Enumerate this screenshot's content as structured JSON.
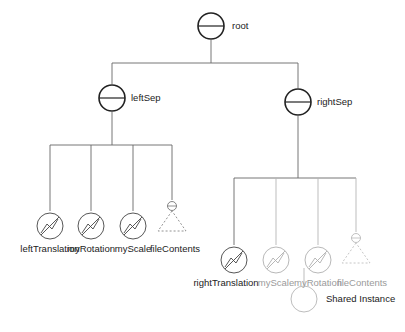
{
  "diagram": {
    "type": "scene-graph",
    "nodes": [
      {
        "id": "root",
        "label": "root",
        "kind": "separator",
        "shared": false
      },
      {
        "id": "leftSep",
        "label": "leftSep",
        "kind": "separator",
        "shared": false
      },
      {
        "id": "rightSep",
        "label": "rightSep",
        "kind": "separator",
        "shared": false
      },
      {
        "id": "leftTranslation",
        "label": "leftTranslation",
        "kind": "transform",
        "shared": false
      },
      {
        "id": "myRotation_l",
        "label": "myRotation",
        "kind": "transform",
        "shared": true
      },
      {
        "id": "myScale_l",
        "label": "myScale",
        "kind": "transform",
        "shared": true
      },
      {
        "id": "fileContents_l",
        "label": "fileContents",
        "kind": "subgraph",
        "shared": true
      },
      {
        "id": "rightTranslation",
        "label": "rightTranslation",
        "kind": "transform",
        "shared": false
      },
      {
        "id": "myScale_r",
        "label": "myScale",
        "kind": "transform",
        "shared": true
      },
      {
        "id": "myRotation_r",
        "label": "myRotation",
        "kind": "transform",
        "shared": true
      },
      {
        "id": "fileContents_r",
        "label": "fileContents",
        "kind": "subgraph",
        "shared": true
      }
    ],
    "edges": [
      [
        "root",
        "leftSep"
      ],
      [
        "root",
        "rightSep"
      ],
      [
        "leftSep",
        "leftTranslation"
      ],
      [
        "leftSep",
        "myRotation_l"
      ],
      [
        "leftSep",
        "myScale_l"
      ],
      [
        "leftSep",
        "fileContents_l"
      ],
      [
        "rightSep",
        "rightTranslation"
      ],
      [
        "rightSep",
        "myScale_r"
      ],
      [
        "rightSep",
        "myRotation_r"
      ],
      [
        "rightSep",
        "fileContents_r"
      ]
    ],
    "legend": {
      "icon": "empty-circle",
      "label": "Shared Instance"
    }
  },
  "labels": {
    "root": "root",
    "leftSep": "leftSep",
    "rightSep": "rightSep",
    "leftTranslation": "leftTranslation",
    "myRotation_l": "myRotation",
    "myScale_l": "myScale",
    "fileContents_l": "fileContents",
    "rightTranslation": "rightTranslation",
    "myScale_r": "myScale",
    "myRotation_r": "myRotation",
    "fileContents_r": "fileContents",
    "legend": "Shared Instance"
  },
  "colors": {
    "line": "#555555",
    "node_stroke": "#222222",
    "faded": "#a8a8a8"
  }
}
